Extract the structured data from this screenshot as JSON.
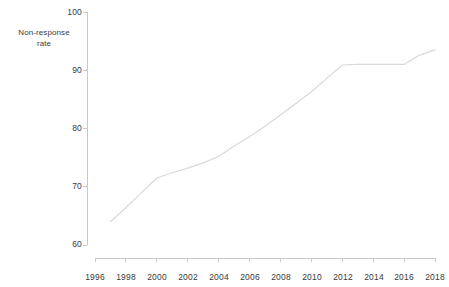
{
  "chart_data": {
    "type": "line",
    "title": "",
    "subtitle": "",
    "xlabel": "",
    "ylabel": "Non-response\nrate",
    "ylabel_line1": "Non-response",
    "ylabel_line2": "rate",
    "xlim": [
      1996,
      2018
    ],
    "ylim": [
      60,
      100
    ],
    "grid": false,
    "legend": null,
    "x_ticks": [
      1996,
      1998,
      2000,
      2002,
      2004,
      2006,
      2008,
      2010,
      2012,
      2014,
      2016,
      2018
    ],
    "x_tick_labels": [
      "1996",
      "1998",
      "2000",
      "2002",
      "2004",
      "2006",
      "2008",
      "2010",
      "2012",
      "2014",
      "2016",
      "2018"
    ],
    "y_ticks": [
      60,
      70,
      80,
      90,
      100
    ],
    "y_tick_labels": [
      "60",
      "70",
      "80",
      "90",
      "100"
    ],
    "line_color": "#d9d9d9",
    "axis_color": "#c9c9c9",
    "text_color": "#3a3a3a",
    "series": [
      {
        "name": "Non-response rate",
        "x": [
          1997,
          1998,
          1999,
          2000,
          2001,
          2002,
          2003,
          2004,
          2005,
          2006,
          2007,
          2008,
          2009,
          2010,
          2011,
          2012,
          2013,
          2014,
          2015,
          2016,
          2017,
          2018
        ],
        "values": [
          64.0,
          66.4,
          69.0,
          71.5,
          72.4,
          73.2,
          74.1,
          75.2,
          77.0,
          78.6,
          80.4,
          82.3,
          84.3,
          86.3,
          88.6,
          90.9,
          91.0,
          91.0,
          91.0,
          91.0,
          92.6,
          93.5
        ]
      }
    ]
  }
}
